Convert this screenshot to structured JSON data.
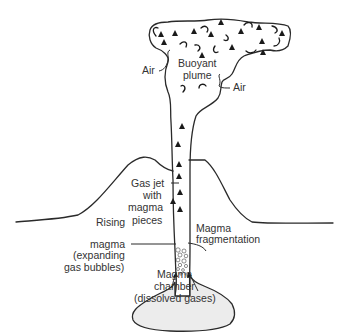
{
  "diagram": {
    "labels": {
      "air_left": "Air",
      "buoyant_plume_1": "Buoyant",
      "buoyant_plume_2": "plume",
      "air_right": "Air",
      "gas_jet_1": "Gas jet",
      "gas_jet_2": "with",
      "gas_jet_3": "magma",
      "gas_jet_4": "pieces",
      "rising_1": "Rising",
      "rising_2": "magma",
      "rising_3": "(expanding",
      "rising_4": "gas bubbles)",
      "frag_1": "Magma",
      "frag_2": "fragmentation",
      "chamber_1": "Magma",
      "chamber_2": "chamber",
      "chamber_3": "(dissolved gases)"
    },
    "colors": {
      "line": "#2a2a2a",
      "chamber_fill": "#ececec",
      "text": "#333333"
    }
  }
}
